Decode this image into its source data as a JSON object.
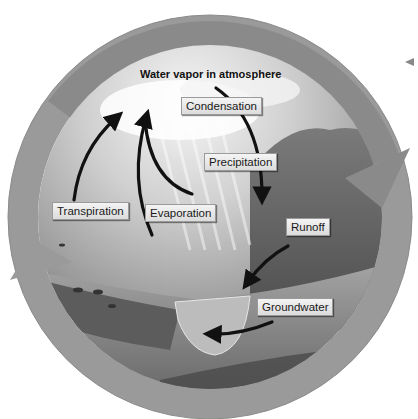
{
  "diagram": {
    "title": "Water vapor in atmosphere",
    "labels": {
      "condensation": "Condensation",
      "precipitation": "Precipitation",
      "transpiration": "Transpiration",
      "evaporation": "Evaporation",
      "runoff": "Runoff",
      "groundwater": "Groundwater"
    },
    "colors": {
      "ring": "#8c8c8c",
      "ring_light": "#a8a8a8",
      "sky": "#d9d9d9",
      "land": "#6e6e6e",
      "arrow": "#111111",
      "label_bg": "#e8e8e8"
    }
  }
}
